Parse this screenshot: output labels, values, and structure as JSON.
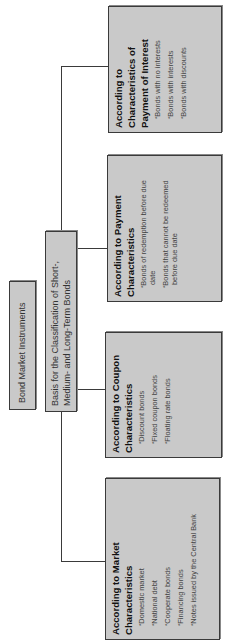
{
  "diagram": {
    "root": {
      "label": "Bond Market Instruments"
    },
    "basis": {
      "label": "Basis for the Classification of Short-, Medium- and Long-Term Bonds"
    },
    "categories": [
      {
        "title": "According to Market Characteristics",
        "items": [
          "Domestic market",
          "National debt",
          "Cooperate bonds",
          "Financing bonds",
          "Notes issued by the Central Bank"
        ]
      },
      {
        "title": "According to Coupon Characteristics",
        "items": [
          "Discount bonds",
          "Fixed coupon bonds",
          "Floating rate bonds"
        ]
      },
      {
        "title": "According to Payment Characteristics",
        "items": [
          "Bonds of redemption before due date",
          "Bonds that cannot be redeemed before due date"
        ]
      },
      {
        "title": "According to Characteristics of Payment of Interest",
        "items": [
          "Bonds with no interests",
          "Bonds with interests",
          "Bonds with discounts"
        ]
      }
    ],
    "colors": {
      "box_fill": "#c9c9c9",
      "box_border": "#3a3a3a",
      "line": "#3a3a3a",
      "background": "#ffffff"
    },
    "orientation": "rotated 90 degrees counter-clockwise"
  }
}
